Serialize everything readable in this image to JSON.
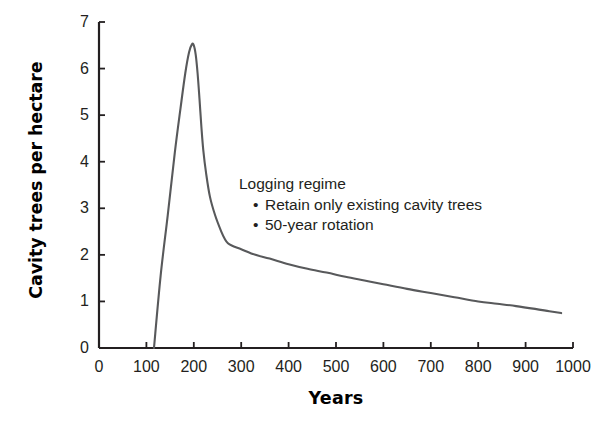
{
  "chart_data": {
    "type": "line",
    "title": "",
    "xlabel": "Years",
    "ylabel": "Cavity trees per hectare",
    "xlim": [
      0,
      1000
    ],
    "ylim": [
      0,
      7
    ],
    "xticks": [
      0,
      100,
      200,
      300,
      400,
      500,
      600,
      700,
      800,
      900,
      1000
    ],
    "yticks": [
      0,
      1,
      2,
      3,
      4,
      5,
      6,
      7
    ],
    "xtick_labels": [
      "0",
      "100",
      "200",
      "300",
      "400",
      "500",
      "600",
      "700",
      "800",
      "900",
      "1000"
    ],
    "ytick_labels": [
      "0",
      "1",
      "2",
      "3",
      "4",
      "5",
      "6",
      "7"
    ],
    "grid": false,
    "legend": null,
    "line_color": "#58595b",
    "line_width": 2.1,
    "series": [
      {
        "name": "Cavity trees per hectare",
        "x": [
          116,
          130,
          145,
          160,
          172,
          182,
          190,
          196,
          200,
          204,
          208,
          212,
          216,
          220,
          226,
          234,
          245,
          258,
          266,
          272,
          280,
          300,
          330,
          360,
          400,
          440,
          480,
          520,
          560,
          600,
          650,
          700,
          750,
          800,
          840,
          880,
          920,
          950,
          975
        ],
        "y": [
          0.0,
          1.55,
          2.85,
          4.2,
          5.15,
          5.9,
          6.35,
          6.52,
          6.5,
          6.3,
          5.9,
          5.35,
          4.75,
          4.25,
          3.75,
          3.25,
          2.85,
          2.5,
          2.33,
          2.25,
          2.2,
          2.12,
          2.0,
          1.92,
          1.8,
          1.7,
          1.62,
          1.53,
          1.45,
          1.37,
          1.27,
          1.18,
          1.09,
          1.0,
          0.95,
          0.9,
          0.84,
          0.79,
          0.75
        ]
      }
    ],
    "annotations": [
      {
        "name": "logging-regime-note",
        "head": "Logging regime",
        "bullets": [
          "Retain only existing cavity trees",
          "50-year rotation"
        ],
        "bullet_char": "•",
        "x_px": 239,
        "y_px": 174
      }
    ],
    "peak": {
      "x": 196,
      "y": 6.52
    },
    "start": {
      "x": 116,
      "y": 0.0
    },
    "end": {
      "x": 975,
      "y": 0.75
    }
  },
  "axes": {
    "origin_px": {
      "x": 99,
      "y": 348
    },
    "x_end_px": 573,
    "y_top_px": 22,
    "axis_color": "#231f20",
    "axis_width": 2.2,
    "tick_length": 6
  },
  "colors": {
    "background": "#ffffff",
    "line": "#58595b",
    "axis": "#231f20",
    "text": "#231f20",
    "title_text": "#000000"
  }
}
